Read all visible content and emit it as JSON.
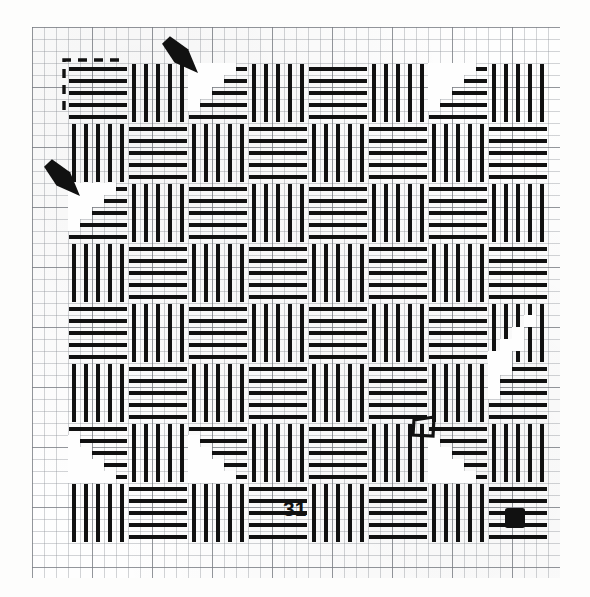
{
  "figure": {
    "kind": "weaving-draft",
    "label": "31",
    "label_x": 283,
    "label_y": 498,
    "ink_color": "#111111",
    "grid_color": "#9a9ea4",
    "grid_major_color": "#787c82",
    "paper_color": "#fefefe",
    "background_color": "#ffffff"
  },
  "grid": {
    "origin_x": 32,
    "origin_y": 27,
    "width": 528,
    "height": 551,
    "minor_step": 12,
    "major_step": 60,
    "cols": 44,
    "rows": 46
  },
  "annotations": {
    "repeat_corner": {
      "name": "dashed-repeat-corner",
      "x": 64,
      "y": 60,
      "w": 62,
      "h": 50,
      "style": "dashed"
    },
    "arrows": [
      {
        "name": "arrow-top",
        "tip_x": 198,
        "tip_y": 73,
        "tail_x": 166,
        "tail_y": 40
      },
      {
        "name": "arrow-left",
        "tip_x": 80,
        "tip_y": 196,
        "tail_x": 48,
        "tail_y": 163
      }
    ],
    "hollow_square": {
      "name": "hollow-square-marker",
      "x": 413,
      "y": 417,
      "w": 21,
      "h": 19
    },
    "filled_square": {
      "name": "filled-square-marker",
      "x": 505,
      "y": 508,
      "w": 20,
      "h": 20
    }
  },
  "chart_data": {
    "type": "heatmap",
    "title": "31",
    "xlabel": "",
    "ylabel": "",
    "cell": 12,
    "block_cols": [
      {
        "start": 3,
        "span": 5
      },
      {
        "start": 8,
        "span": 5
      },
      {
        "start": 13,
        "span": 5
      },
      {
        "start": 18,
        "span": 5
      },
      {
        "start": 23,
        "span": 5
      },
      {
        "start": 28,
        "span": 5
      },
      {
        "start": 33,
        "span": 5
      },
      {
        "start": 38,
        "span": 5
      }
    ],
    "block_rows": [
      {
        "start": 3,
        "span": 5
      },
      {
        "start": 8,
        "span": 5
      },
      {
        "start": 13,
        "span": 5
      },
      {
        "start": 18,
        "span": 5
      },
      {
        "start": 23,
        "span": 5
      },
      {
        "start": 28,
        "span": 5
      },
      {
        "start": 33,
        "span": 5
      },
      {
        "start": 38,
        "span": 5
      }
    ],
    "legend": [],
    "grid": true
  }
}
